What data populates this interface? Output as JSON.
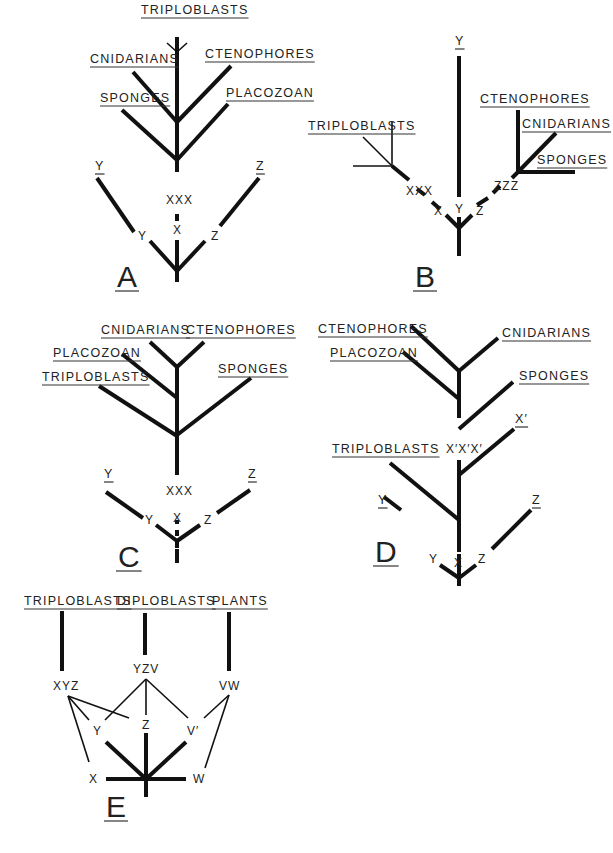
{
  "figure": {
    "panels": [
      {
        "id": "A",
        "letter": "A",
        "letter_pos": [
          117,
          287
        ],
        "thick_lines": [
          [
            177,
            37,
            177,
            150
          ],
          [
            177,
            122,
            133,
            72
          ],
          [
            177,
            122,
            231,
            66
          ],
          [
            177,
            160,
            122,
            110
          ],
          [
            177,
            160,
            228,
            104
          ],
          [
            177,
            150,
            177,
            160
          ],
          [
            177,
            160,
            177,
            172
          ],
          [
            177,
            214,
            177,
            221
          ],
          [
            177,
            240,
            177,
            282
          ],
          [
            177,
            271,
            150,
            241
          ],
          [
            177,
            271,
            205,
            241
          ],
          [
            134,
            232,
            97,
            178
          ],
          [
            220,
            226,
            259,
            178
          ]
        ],
        "thin_lines": [
          [
            177,
            52,
            167,
            43
          ],
          [
            177,
            52,
            187,
            43
          ]
        ],
        "labels": [
          {
            "text": "TRIPLOBLASTS",
            "x": 141,
            "y": 14,
            "ul": true
          },
          {
            "text": "CNIDARIANS",
            "x": 90,
            "y": 63,
            "ul": true
          },
          {
            "text": "CTENOPHORES",
            "x": 205,
            "y": 58,
            "ul": true
          },
          {
            "text": "SPONGES",
            "x": 100,
            "y": 102,
            "ul": true
          },
          {
            "text": "PLACOZOAN",
            "x": 226,
            "y": 97,
            "ul": true
          },
          {
            "text": "Y",
            "x": 95,
            "y": 170,
            "ul": true
          },
          {
            "text": "Z",
            "x": 256,
            "y": 170,
            "ul": true
          },
          {
            "text": "XXX",
            "x": 166,
            "y": 204,
            "ul": false
          },
          {
            "text": "X",
            "x": 173,
            "y": 234,
            "ul": false
          },
          {
            "text": "Y",
            "x": 138,
            "y": 240,
            "ul": false
          },
          {
            "text": "Z",
            "x": 211,
            "y": 240,
            "ul": false
          }
        ]
      },
      {
        "id": "B",
        "letter": "B",
        "letter_pos": [
          415,
          287
        ],
        "thick_lines": [
          [
            459,
            56,
            459,
            197
          ],
          [
            459,
            217,
            459,
            256
          ],
          [
            459,
            228,
            446,
            215
          ],
          [
            459,
            228,
            472,
            215
          ],
          [
            440,
            209,
            432,
            202
          ],
          [
            425,
            195,
            417,
            189
          ],
          [
            477,
            205,
            488,
            198
          ],
          [
            493,
            193,
            500,
            186
          ],
          [
            392,
            166,
            409,
            180
          ],
          [
            518,
            110,
            518,
            172
          ],
          [
            518,
            172,
            556,
            133
          ],
          [
            518,
            172,
            575,
            172
          ],
          [
            518,
            172,
            512,
            178
          ]
        ],
        "thin_lines": [
          [
            392,
            122,
            392,
            166
          ],
          [
            392,
            166,
            353,
            166
          ],
          [
            392,
            166,
            363,
            137
          ]
        ],
        "labels": [
          {
            "text": "Y",
            "x": 455,
            "y": 45,
            "ul": true
          },
          {
            "text": "CTENOPHORES",
            "x": 480,
            "y": 103,
            "ul": true
          },
          {
            "text": "CNIDARIANS",
            "x": 522,
            "y": 128,
            "ul": true
          },
          {
            "text": "SPONGES",
            "x": 537,
            "y": 164,
            "ul": true
          },
          {
            "text": "TRIPLOBLASTS",
            "x": 308,
            "y": 130,
            "ul": true
          },
          {
            "text": "XXX",
            "x": 406,
            "y": 195,
            "ul": false
          },
          {
            "text": "ZZZ",
            "x": 494,
            "y": 190,
            "ul": false
          },
          {
            "text": "X",
            "x": 434,
            "y": 215,
            "ul": false
          },
          {
            "text": "Y",
            "x": 455,
            "y": 213,
            "ul": false
          },
          {
            "text": "Z",
            "x": 476,
            "y": 215,
            "ul": false
          }
        ]
      },
      {
        "id": "C",
        "letter": "C",
        "letter_pos": [
          118,
          567
        ],
        "thick_lines": [
          [
            177,
            367,
            177,
            475
          ],
          [
            177,
            367,
            150,
            342
          ],
          [
            177,
            367,
            204,
            342
          ],
          [
            177,
            398,
            122,
            354
          ],
          [
            177,
            436,
            99,
            386
          ],
          [
            177,
            435,
            251,
            378
          ],
          [
            177,
            520,
            177,
            524
          ],
          [
            177,
            530,
            177,
            536
          ],
          [
            177,
            549,
            177,
            555
          ],
          [
            177,
            540,
            177,
            548
          ],
          [
            177,
            555,
            177,
            563
          ],
          [
            177,
            541,
            156,
            525
          ],
          [
            177,
            541,
            200,
            525
          ],
          [
            143,
            518,
            106,
            492
          ],
          [
            217,
            513,
            250,
            490
          ]
        ],
        "thin_lines": [],
        "labels": [
          {
            "text": "CNIDARIANS",
            "x": 101,
            "y": 334,
            "ul": true
          },
          {
            "text": "CTENOPHORES",
            "x": 186,
            "y": 334,
            "ul": true
          },
          {
            "text": "PLACOZOAN",
            "x": 53,
            "y": 357,
            "ul": true
          },
          {
            "text": "SPONGES",
            "x": 218,
            "y": 373,
            "ul": true
          },
          {
            "text": "TRIPLOBLASTS",
            "x": 42,
            "y": 381,
            "ul": true
          },
          {
            "text": "Y",
            "x": 104,
            "y": 478,
            "ul": true
          },
          {
            "text": "Z",
            "x": 248,
            "y": 478,
            "ul": true
          },
          {
            "text": "XXX",
            "x": 166,
            "y": 495,
            "ul": false
          },
          {
            "text": "X",
            "x": 173,
            "y": 522,
            "ul": false
          },
          {
            "text": "Y",
            "x": 145,
            "y": 524,
            "ul": false
          },
          {
            "text": "Z",
            "x": 204,
            "y": 524,
            "ul": false
          }
        ]
      },
      {
        "id": "D",
        "letter": "D",
        "letter_pos": [
          375,
          562
        ],
        "thick_lines": [
          [
            459,
            371,
            459,
            418
          ],
          [
            459,
            371,
            411,
            326
          ],
          [
            459,
            371,
            498,
            338
          ],
          [
            459,
            399,
            403,
            352
          ],
          [
            459,
            429,
            513,
            382
          ],
          [
            459,
            460,
            459,
            552
          ],
          [
            459,
            475,
            514,
            429
          ],
          [
            459,
            520,
            390,
            463
          ],
          [
            459,
            554,
            459,
            586
          ],
          [
            459,
            578,
            440,
            565
          ],
          [
            459,
            578,
            476,
            565
          ],
          [
            401,
            510,
            384,
            497
          ],
          [
            492,
            549,
            531,
            510
          ]
        ],
        "thin_lines": [],
        "labels": [
          {
            "text": "CTENOPHORES",
            "x": 318,
            "y": 333,
            "ul": true
          },
          {
            "text": "CNIDARIANS",
            "x": 502,
            "y": 337,
            "ul": true
          },
          {
            "text": "PLACOZOAN",
            "x": 330,
            "y": 357,
            "ul": true
          },
          {
            "text": "SPONGES",
            "x": 519,
            "y": 380,
            "ul": true
          },
          {
            "text": "X′",
            "x": 515,
            "y": 423,
            "ul": true
          },
          {
            "text": "TRIPLOBLASTS",
            "x": 332,
            "y": 453,
            "ul": true
          },
          {
            "text": "X′X′X′",
            "x": 446,
            "y": 453,
            "ul": false
          },
          {
            "text": "Y",
            "x": 378,
            "y": 504,
            "ul": true
          },
          {
            "text": "Z",
            "x": 532,
            "y": 504,
            "ul": true
          },
          {
            "text": "Y",
            "x": 429,
            "y": 563,
            "ul": false
          },
          {
            "text": "X",
            "x": 454,
            "y": 567,
            "ul": false
          },
          {
            "text": "Z",
            "x": 478,
            "y": 563,
            "ul": false
          }
        ]
      },
      {
        "id": "E",
        "letter": "E",
        "letter_pos": [
          106,
          817
        ],
        "thick_lines": [
          [
            62,
            611,
            62,
            671
          ],
          [
            145,
            613,
            145,
            655
          ],
          [
            229,
            612,
            229,
            671
          ],
          [
            146,
            733,
            146,
            797
          ],
          [
            106,
            742,
            146,
            779
          ],
          [
            186,
            742,
            146,
            779
          ],
          [
            106,
            779,
            186,
            779
          ]
        ],
        "thin_lines": [
          [
            68,
            696,
            89,
            720
          ],
          [
            68,
            696,
            129,
            718
          ],
          [
            68,
            696,
            89,
            762
          ],
          [
            146,
            679,
            105,
            720
          ],
          [
            146,
            679,
            146,
            715
          ],
          [
            146,
            679,
            188,
            718
          ],
          [
            229,
            695,
            204,
            718
          ],
          [
            229,
            695,
            205,
            768
          ]
        ],
        "labels": [
          {
            "text": "TRIPLOBLASTS",
            "x": 24,
            "y": 605,
            "ul": true
          },
          {
            "text": "DIPLOBLASTS",
            "x": 117,
            "y": 605,
            "ul": true
          },
          {
            "text": "PLANTS",
            "x": 212,
            "y": 605,
            "ul": true
          },
          {
            "text": "YZV",
            "x": 133,
            "y": 673,
            "ul": false
          },
          {
            "text": "XYZ",
            "x": 53,
            "y": 690,
            "ul": false
          },
          {
            "text": "VW",
            "x": 219,
            "y": 690,
            "ul": false
          },
          {
            "text": "Y",
            "x": 93,
            "y": 735,
            "ul": false
          },
          {
            "text": "Z",
            "x": 142,
            "y": 729,
            "ul": false
          },
          {
            "text": "V′",
            "x": 187,
            "y": 735,
            "ul": false
          },
          {
            "text": "X",
            "x": 89,
            "y": 783,
            "ul": false
          },
          {
            "text": "W",
            "x": 193,
            "y": 783,
            "ul": false
          }
        ]
      }
    ]
  }
}
